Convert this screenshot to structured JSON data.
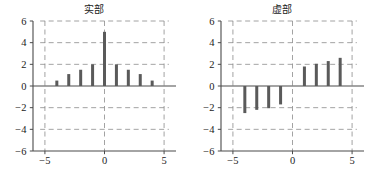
{
  "figure": {
    "panels": [
      {
        "id": "real-part",
        "title": "实部"
      },
      {
        "id": "imaginary-part",
        "title": "虚部"
      }
    ]
  },
  "chart_data": [
    {
      "type": "bar",
      "id": "real-part",
      "title": "实部",
      "xlabel": "",
      "ylabel": "",
      "x": [
        -4,
        -3,
        -2,
        -1,
        0,
        1,
        2,
        3,
        4
      ],
      "values": [
        0.5,
        1.1,
        1.5,
        2.0,
        5.0,
        2.0,
        1.5,
        1.1,
        0.5
      ],
      "xlim": [
        -6,
        6
      ],
      "ylim": [
        -6,
        6
      ],
      "xticks": [
        -5,
        0,
        5
      ],
      "xticklabels": [
        "−5",
        "0",
        "5"
      ],
      "yticks": [
        -6,
        -4,
        -2,
        0,
        2,
        4,
        6
      ],
      "yticklabels": [
        "−6",
        "−4",
        "−2",
        "0",
        "2",
        "4",
        "6"
      ],
      "grid": true,
      "grid_style": "dashed",
      "legend": null,
      "bar_color": "#5a5a5a"
    },
    {
      "type": "bar",
      "id": "imaginary-part",
      "title": "虚部",
      "xlabel": "",
      "ylabel": "",
      "x": [
        -4,
        -3,
        -2,
        -1,
        1,
        2,
        3,
        4
      ],
      "values": [
        -2.5,
        -2.2,
        -2.05,
        -1.7,
        1.8,
        2.05,
        2.3,
        2.6
      ],
      "xlim": [
        -6,
        6
      ],
      "ylim": [
        -6,
        6
      ],
      "xticks": [
        -5,
        0,
        5
      ],
      "xticklabels": [
        "−5",
        "0",
        "5"
      ],
      "yticks": [
        -6,
        -4,
        -2,
        0,
        2,
        4,
        6
      ],
      "yticklabels": [
        "−6",
        "−4",
        "−2",
        "0",
        "2",
        "4",
        "6"
      ],
      "grid": true,
      "grid_style": "dashed",
      "legend": null,
      "bar_color": "#5a5a5a"
    }
  ],
  "style": {
    "bar_color": "#5a5a5a",
    "axis_color": "#4a4a4a",
    "grid_color": "#8c8c8c",
    "text_color": "#1b1b1b",
    "background": "#ffffff"
  }
}
